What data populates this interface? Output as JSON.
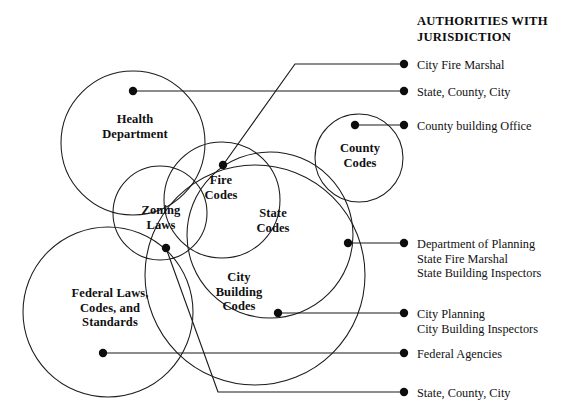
{
  "diagram": {
    "title_lines": "AUTHORITIES WITH\nJURISDICTION",
    "circles": [
      {
        "key": "health_department",
        "label": "Health\nDepartment",
        "cx": 133,
        "cy": 143,
        "r": 72,
        "label_x": 83,
        "label_y": 112,
        "label_w": 104
      },
      {
        "key": "fire_codes",
        "label": "Fire\nCodes",
        "cx": 222,
        "cy": 200,
        "r": 58,
        "label_x": 184,
        "label_y": 173,
        "label_w": 74
      },
      {
        "key": "zoning_laws",
        "label": "Zoning\nLaws",
        "cx": 160,
        "cy": 213,
        "r": 47,
        "label_x": 122,
        "label_y": 203,
        "label_w": 78
      },
      {
        "key": "county_codes",
        "label": "County\nCodes",
        "cx": 359,
        "cy": 158,
        "r": 44,
        "label_x": 322,
        "label_y": 141,
        "label_w": 76
      },
      {
        "key": "state_codes",
        "label": "State\nCodes",
        "cx": 270,
        "cy": 235,
        "r": 83,
        "label_x": 240,
        "label_y": 206,
        "label_w": 66
      },
      {
        "key": "city_building_codes",
        "label": "City\nBuilding\nCodes",
        "cx": 255,
        "cy": 275,
        "r": 110,
        "label_x": 196,
        "label_y": 270,
        "label_w": 86
      },
      {
        "key": "federal_laws",
        "label": "Federal Laws,\nCodes, and\nStandards",
        "cx": 108,
        "cy": 312,
        "r": 85,
        "label_x": 48,
        "label_y": 286,
        "label_w": 124
      }
    ],
    "legend_entries": [
      {
        "key": "city_fire_marshal",
        "text": "City Fire Marshal",
        "text_y": 58,
        "legend_dot": {
          "x": 404,
          "y": 64
        },
        "source_dot": {
          "x": 223,
          "y": 165
        },
        "path": "M 223 165 L 295 64 L 404 64"
      },
      {
        "key": "state_county_city_top",
        "text": "State, County, City",
        "text_y": 85,
        "legend_dot": {
          "x": 404,
          "y": 91
        },
        "source_dot": {
          "x": 133,
          "y": 91
        },
        "path": "M 133 91 L 404 91"
      },
      {
        "key": "county_building_office",
        "text": "County building Office",
        "text_y": 119,
        "legend_dot": {
          "x": 404,
          "y": 125
        },
        "source_dot": {
          "x": 355,
          "y": 125
        },
        "path": "M 355 125 L 404 125"
      },
      {
        "key": "planning_fire_building",
        "text": "Department of Planning\nState Fire Marshal\nState Building Inspectors",
        "text_y": 237,
        "legend_dot": {
          "x": 404,
          "y": 243
        },
        "source_dot": {
          "x": 348,
          "y": 243
        },
        "path": "M 348 243 L 404 243"
      },
      {
        "key": "city_planning_inspectors",
        "text": "City Planning\nCity Building Inspectors",
        "text_y": 307,
        "legend_dot": {
          "x": 404,
          "y": 313
        },
        "source_dot": {
          "x": 278,
          "y": 313
        },
        "path": "M 278 313 L 404 313"
      },
      {
        "key": "federal_agencies",
        "text": "Federal Agencies",
        "text_y": 347,
        "legend_dot": {
          "x": 404,
          "y": 353
        },
        "source_dot": {
          "x": 103,
          "y": 353
        },
        "path": "M 103 353 L 404 353"
      },
      {
        "key": "state_county_city_bottom",
        "text": "State, County, City",
        "text_y": 386,
        "legend_dot": {
          "x": 404,
          "y": 392
        },
        "source_dot": {
          "x": 166,
          "y": 248
        },
        "path": "M 166 248 L 218 392 L 404 392"
      }
    ],
    "colors": {
      "stroke": "#1b1b1b",
      "dot": "#0d0d0d",
      "text": "#111111",
      "background": "#ffffff"
    }
  }
}
